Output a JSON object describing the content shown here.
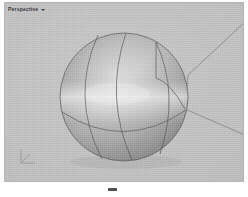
{
  "app": {
    "kind": "3d-modeling-viewport",
    "canvas": {
      "width": 248,
      "height": 197
    }
  },
  "viewport": {
    "title": "Perspective",
    "caret": "chevron-down-icon",
    "bounds": {
      "x": 4,
      "y": 2,
      "width": 240,
      "height": 180
    },
    "background_color": "#c2c2c2",
    "border_color": "#b4b4b4",
    "shading_mode": "shaded"
  },
  "gnomon": {
    "name": "axis-gnomon",
    "axes": [
      "x",
      "y",
      "z"
    ],
    "color": "#6b6b6b"
  },
  "scene": {
    "objects": [
      {
        "name": "sphere",
        "type": "nurbs-sphere",
        "selected": false,
        "center": {
          "x": 124,
          "y": 96
        },
        "radius": 64,
        "surface_light": "#e2e2e2",
        "surface_mid": "#b6b6b6",
        "surface_dark": "#7e7e7e",
        "isocurve_color": "#5a5a5f",
        "isocurves": {
          "meridians": 3,
          "latitudes": 1
        }
      }
    ],
    "construction_plane": {
      "name": "cplane-axis-lines",
      "color": "#76767c",
      "lines": [
        {
          "label": "axis-line-upper-right",
          "from": [
            188,
            74
          ],
          "to": [
            246,
            20
          ]
        },
        {
          "label": "axis-line-lower-right",
          "from": [
            185,
            108
          ],
          "to": [
            246,
            135
          ]
        }
      ]
    }
  },
  "status": {
    "bottom_mark": "selection-marker"
  },
  "colors": {
    "viewport_bg": "#c2c2c2",
    "page_bg": "#ffffff",
    "wire": "#5a5a5f",
    "title_text": "#2e2e33"
  }
}
